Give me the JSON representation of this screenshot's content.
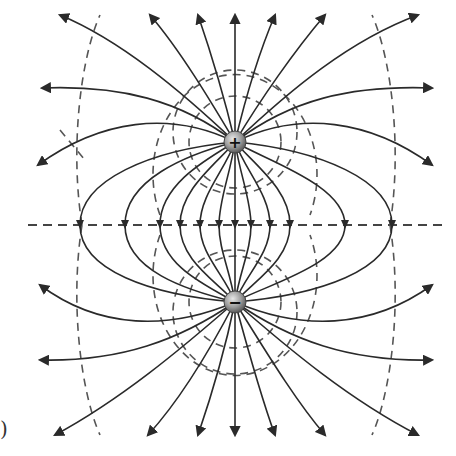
{
  "diagram": {
    "panel_label": ")",
    "positive_charge": {
      "symbol": "+",
      "x": 235,
      "y": 142,
      "color": "#8a8a8a"
    },
    "negative_charge": {
      "symbol": "−",
      "x": 235,
      "y": 302,
      "color": "#8a8a8a"
    },
    "bisector_y": 225,
    "line_color": "#2a2a2a",
    "equipotential_color": "#555555",
    "legend": {
      "solid_lines": "electric field lines (from + to −)",
      "dashed_lines": "equipotential surfaces"
    }
  }
}
